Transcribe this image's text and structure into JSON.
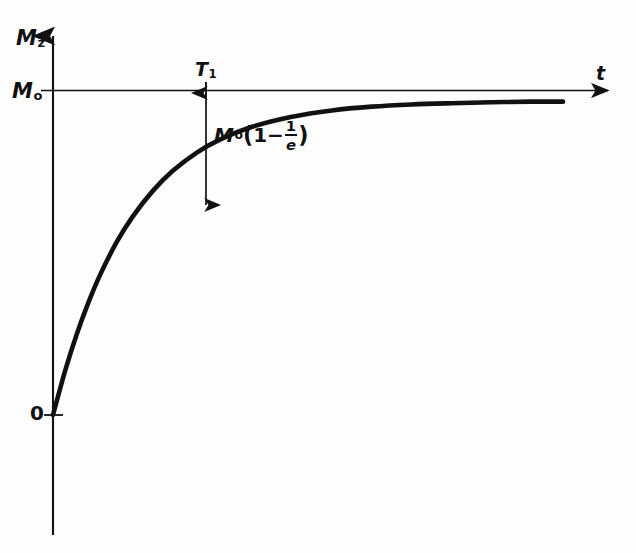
{
  "figure": {
    "background_color": "#fdfdfd",
    "ink_color": "#111111"
  },
  "labels": {
    "y_axis": {
      "base": "M",
      "sub": "z"
    },
    "y_tick_m0": {
      "base": "M",
      "sub": "o"
    },
    "origin": "0",
    "x_axis": "t",
    "time_constant": {
      "base": "T",
      "sub": "1"
    },
    "amplitude": {
      "base": "M",
      "sub": "o",
      "open_paren": "(",
      "one": "1",
      "minus": "−",
      "frac_num": "1",
      "frac_den": "e",
      "close_paren": ")",
      "plain": "Mo(1−1/e)"
    }
  },
  "caption": "",
  "chart_data": {
    "type": "line",
    "xlabel": "t",
    "ylabel": "Mz",
    "equation": "Mz = Mo(1 - exp(-t/T1))",
    "grid": false,
    "legend": "none",
    "xlim": [
      0,
      7.2
    ],
    "ylim": [
      0,
      1.12
    ],
    "asymptote": {
      "label": "Mo",
      "value": 1.0
    },
    "annotations": [
      {
        "name": "T1",
        "text": "T1",
        "x": 1.0,
        "y": 1.0
      },
      {
        "name": "amplitude-arrow",
        "text": "Mo(1-1/e)",
        "x": 1.0,
        "y_from": 1.0,
        "y_to": 0.632
      },
      {
        "name": "origin",
        "text": "0",
        "x": 0,
        "y": 0
      },
      {
        "name": "t-axis-tip",
        "text": "t",
        "x": 7.2,
        "y": 1.0
      }
    ],
    "x": [
      0,
      0.15,
      0.3,
      0.45,
      0.6,
      0.8,
      1.0,
      1.25,
      1.5,
      1.8,
      2.1,
      2.5,
      3.0,
      3.5,
      4.0,
      4.5,
      5.0,
      5.5,
      6.0,
      6.4
    ],
    "y": [
      0,
      0.139,
      0.259,
      0.362,
      0.451,
      0.551,
      0.632,
      0.713,
      0.777,
      0.835,
      0.878,
      0.918,
      0.95,
      0.97,
      0.982,
      0.989,
      0.993,
      0.996,
      0.998,
      0.998
    ]
  }
}
